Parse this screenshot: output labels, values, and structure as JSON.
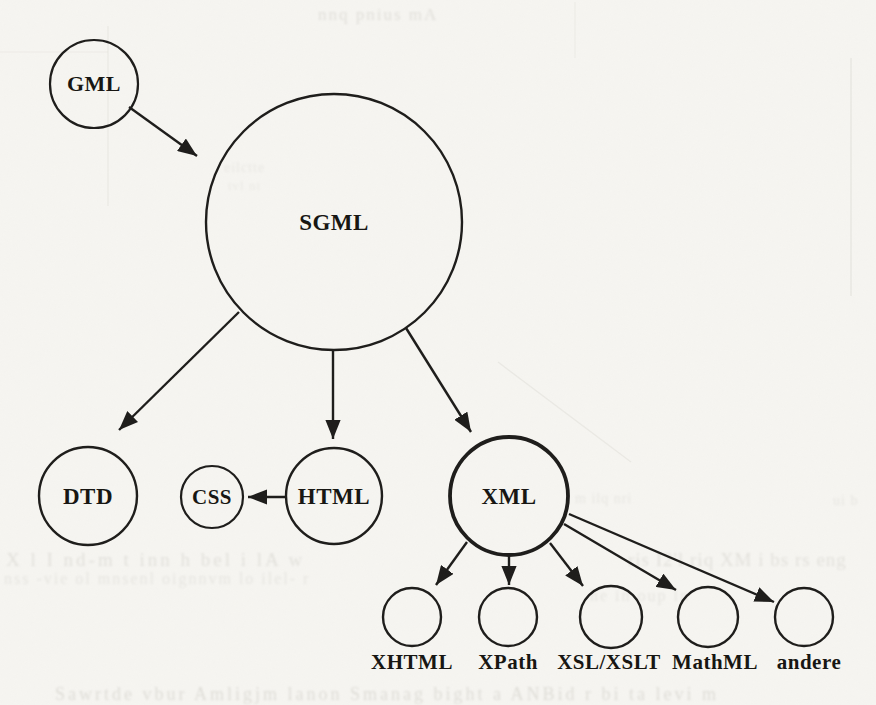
{
  "figure": {
    "description": "Scanned book figure: evolution diagram of markup languages from GML and SGML to XML and its related standards",
    "background_color": "#f6f5f1",
    "ink_color": "#1d1c1a",
    "text_color": "#161511"
  },
  "nodes": [
    {
      "id": "gml",
      "label": "GML",
      "cx": 94,
      "cy": 84,
      "r": 44,
      "stroke_width": 2.2,
      "font_size": 22
    },
    {
      "id": "sgml",
      "label": "SGML",
      "cx": 334,
      "cy": 222,
      "r": 128,
      "stroke_width": 2.4,
      "font_size": 23
    },
    {
      "id": "dtd",
      "label": "DTD",
      "cx": 88,
      "cy": 496,
      "r": 49,
      "stroke_width": 2.4,
      "font_size": 23
    },
    {
      "id": "css",
      "label": "CSS",
      "cx": 212,
      "cy": 497,
      "r": 31,
      "stroke_width": 2.2,
      "font_size": 21
    },
    {
      "id": "html",
      "label": "HTML",
      "cx": 334,
      "cy": 496,
      "r": 48,
      "stroke_width": 2.4,
      "font_size": 23
    },
    {
      "id": "xml",
      "label": "XML",
      "cx": 509,
      "cy": 496,
      "r": 59,
      "stroke_width": 3.8,
      "font_size": 23
    },
    {
      "id": "xhtml",
      "label": "",
      "caption": "XHTML",
      "caption_dx": 0,
      "cx": 412,
      "cy": 617,
      "r": 29,
      "stroke_width": 2.4
    },
    {
      "id": "xpath",
      "label": "",
      "caption": "XPath",
      "caption_dx": 0,
      "cx": 508,
      "cy": 617,
      "r": 29,
      "stroke_width": 2.4
    },
    {
      "id": "xsl-xslt",
      "label": "",
      "caption": "XSL/XSLT",
      "caption_dx": -2,
      "cx": 611,
      "cy": 617,
      "r": 31,
      "stroke_width": 2.4
    },
    {
      "id": "mathml",
      "label": "",
      "caption": "MathML",
      "caption_dx": 7,
      "cx": 708,
      "cy": 617,
      "r": 30,
      "stroke_width": 2.4
    },
    {
      "id": "andere",
      "label": "",
      "caption": "andere",
      "caption_dx": 5,
      "cx": 804,
      "cy": 617,
      "r": 29,
      "stroke_width": 2.4
    }
  ],
  "caption_style": {
    "font_size": 21,
    "baseline_y": 669
  },
  "edges": [
    {
      "from": "gml",
      "to": "sgml",
      "x1": 129,
      "y1": 107,
      "x2": 197,
      "y2": 156
    },
    {
      "from": "sgml",
      "to": "dtd",
      "x1": 239,
      "y1": 312,
      "x2": 119,
      "y2": 430
    },
    {
      "from": "sgml",
      "to": "html",
      "x1": 333,
      "y1": 350,
      "x2": 333,
      "y2": 439
    },
    {
      "from": "sgml",
      "to": "xml",
      "x1": 406,
      "y1": 328,
      "x2": 471,
      "y2": 432
    },
    {
      "from": "html",
      "to": "css",
      "x1": 286,
      "y1": 497,
      "x2": 248,
      "y2": 497
    },
    {
      "from": "xml",
      "to": "xhtml",
      "x1": 467,
      "y1": 542,
      "x2": 436,
      "y2": 585
    },
    {
      "from": "xml",
      "to": "xpath",
      "x1": 509,
      "y1": 555,
      "x2": 509,
      "y2": 585
    },
    {
      "from": "xml",
      "to": "xsl-xslt",
      "x1": 550,
      "y1": 543,
      "x2": 583,
      "y2": 586
    },
    {
      "from": "xml",
      "to": "mathml",
      "x1": 564,
      "y1": 524,
      "x2": 676,
      "y2": 590
    },
    {
      "from": "xml",
      "to": "andere",
      "x1": 569,
      "y1": 514,
      "x2": 774,
      "y2": 602
    }
  ],
  "edge_style": {
    "stroke_width": 2.4
  },
  "scan_artifacts": {
    "faint_lines": [
      {
        "x1": 108,
        "y1": 26,
        "x2": 108,
        "y2": 206,
        "w": 1.2,
        "opacity": 0.1
      },
      {
        "x1": 0,
        "y1": 52,
        "x2": 108,
        "y2": 52,
        "w": 1.2,
        "opacity": 0.08
      },
      {
        "x1": 575,
        "y1": 2,
        "x2": 575,
        "y2": 58,
        "w": 1.2,
        "opacity": 0.08
      },
      {
        "x1": 851,
        "y1": 58,
        "x2": 851,
        "y2": 296,
        "w": 1.4,
        "opacity": 0.12
      },
      {
        "x1": 498,
        "y1": 362,
        "x2": 631,
        "y2": 462,
        "w": 1.4,
        "opacity": 0.1
      }
    ],
    "bleedthrough_text": [
      {
        "text": "nnq pnius mA",
        "x": 318,
        "y": 20,
        "size": 17,
        "opacity": 0.18,
        "ls": 2
      },
      {
        "text": "eilctte",
        "x": 224,
        "y": 172,
        "size": 14,
        "opacity": 0.11,
        "ls": 1
      },
      {
        "text": "tvl ni",
        "x": 228,
        "y": 190,
        "size": 13,
        "opacity": 0.1,
        "ls": 1
      },
      {
        "text": "X l I nd-m t inn h bel  i lA w",
        "x": 6,
        "y": 566,
        "size": 19,
        "opacity": 0.17,
        "ls": 3
      },
      {
        "text": "nss -vie ol  mnsenl oignnvm  lo  ilel- r",
        "x": 4,
        "y": 584,
        "size": 16,
        "opacity": 0.13,
        "ls": 2
      },
      {
        "text": "ris I2'l riq XM i bs rs eng",
        "x": 628,
        "y": 566,
        "size": 19,
        "opacity": 0.16,
        "ls": 1
      },
      {
        "text": "he in oup ln",
        "x": 590,
        "y": 601,
        "size": 16,
        "opacity": 0.13,
        "ls": 2
      },
      {
        "text": "m ilq nri",
        "x": 575,
        "y": 503,
        "size": 14,
        "opacity": 0.12,
        "ls": 1
      },
      {
        "text": "ui b",
        "x": 833,
        "y": 505,
        "size": 14,
        "opacity": 0.13,
        "ls": 1
      },
      {
        "text": "Sawrtde vbur Amligjm lanon Smanag bight a ANBid r   bi ta levi m",
        "x": 55,
        "y": 700,
        "size": 18,
        "opacity": 0.2,
        "ls": 3
      }
    ]
  }
}
